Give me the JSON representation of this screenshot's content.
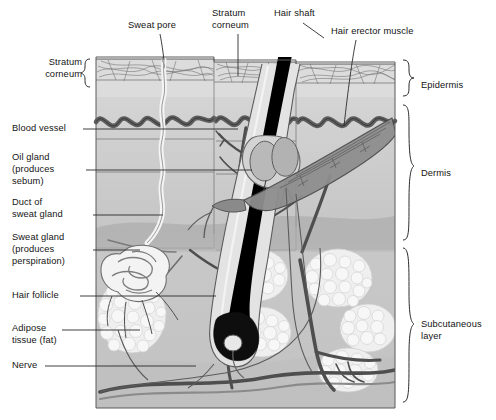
{
  "diagram": {
    "type": "anatomical-cross-section",
    "background": "#ffffff",
    "colors": {
      "epidermis_fill": "#d8d8d8",
      "dermis_fill": "#c9c9c9",
      "dermis_fill_light": "#d3d3d3",
      "subcutaneous_fill": "#c6c6c6",
      "fat_lobule_fill": "#f0f0f0",
      "vessel_dark": "#4a4a4a",
      "vessel_mid": "#7a7a7a",
      "hair_shaft": "#000000",
      "muscle_fill": "#8d8d8d",
      "duct_fill": "#f2f2f2",
      "outline": "#3a3a3a",
      "label_text": "#141414",
      "leader_line": "#2b2b2b"
    }
  },
  "labels_left": [
    {
      "id": "stratum-corneum-left",
      "lines": [
        "Stratum",
        "corneum"
      ],
      "brace": "{",
      "x": 27,
      "y": 56,
      "leader": false
    },
    {
      "id": "blood-vessel",
      "lines": [
        "Blood vessel"
      ],
      "x": 12,
      "y": 124,
      "leader": true
    },
    {
      "id": "oil-gland",
      "lines": [
        "Oil gland",
        "(produces",
        "sebum)"
      ],
      "x": 12,
      "y": 152,
      "leader": true
    },
    {
      "id": "duct-of-sweat-gland",
      "lines": [
        "Duct of",
        "sweat gland"
      ],
      "x": 12,
      "y": 202,
      "leader": true
    },
    {
      "id": "sweat-gland",
      "lines": [
        "Sweat gland",
        "(produces",
        "perspiration)"
      ],
      "x": 12,
      "y": 232,
      "leader": true
    },
    {
      "id": "hair-follicle",
      "lines": [
        "Hair follicle"
      ],
      "x": 12,
      "y": 291,
      "leader": true
    },
    {
      "id": "adipose-tissue",
      "lines": [
        "Adipose",
        "tissue (fat)"
      ],
      "x": 12,
      "y": 323,
      "leader": true
    },
    {
      "id": "nerve",
      "lines": [
        "Nerve"
      ],
      "x": 12,
      "y": 361,
      "leader": true
    }
  ],
  "labels_top": [
    {
      "id": "sweat-pore",
      "lines": [
        "Sweat pore"
      ],
      "x": 128,
      "y": 20
    },
    {
      "id": "stratum-corneum-top",
      "lines": [
        "Stratum",
        "corneum"
      ],
      "x": 213,
      "y": 8
    },
    {
      "id": "hair-shaft",
      "lines": [
        "Hair shaft"
      ],
      "x": 275,
      "y": 8
    },
    {
      "id": "hair-erector-muscle",
      "lines": [
        "Hair erector muscle"
      ],
      "x": 332,
      "y": 27
    }
  ],
  "labels_right": [
    {
      "id": "epidermis",
      "lines": [
        "Epidermis"
      ],
      "x": 424,
      "y": 80,
      "brace": "}"
    },
    {
      "id": "dermis",
      "lines": [
        "Dermis"
      ],
      "x": 424,
      "y": 168,
      "brace": "}"
    },
    {
      "id": "subcutaneous-layer",
      "lines": [
        "Subcutaneous",
        "layer"
      ],
      "x": 424,
      "y": 322,
      "brace": "}"
    }
  ]
}
